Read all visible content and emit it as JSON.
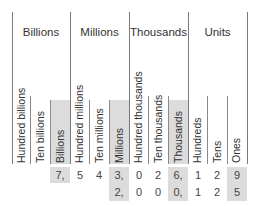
{
  "groups": [
    {
      "label": "Billions"
    },
    {
      "label": "Millions"
    },
    {
      "label": "Thousands"
    },
    {
      "label": "Units"
    }
  ],
  "columns": [
    {
      "label": "Hundred billions",
      "shaded": false
    },
    {
      "label": "Ten billions",
      "shaded": false
    },
    {
      "label": "Billions",
      "shaded": true
    },
    {
      "label": "Hundred millions",
      "shaded": false
    },
    {
      "label": "Ten millions",
      "shaded": false
    },
    {
      "label": "Millions",
      "shaded": true
    },
    {
      "label": "Hundred thousands",
      "shaded": false
    },
    {
      "label": "Ten thousands",
      "shaded": false
    },
    {
      "label": "Thousands",
      "shaded": true
    },
    {
      "label": "Hundreds",
      "shaded": false
    },
    {
      "label": "Tens",
      "shaded": false
    },
    {
      "label": "Ones",
      "shaded": true
    }
  ],
  "rows": [
    {
      "cells": [
        "",
        "",
        "7,",
        "5",
        "4",
        "3,",
        "0",
        "2",
        "6,",
        "1",
        "2",
        "9"
      ]
    },
    {
      "cells": [
        "",
        "",
        "",
        "",
        "",
        "2,",
        "0",
        "0",
        "0,",
        "1",
        "2",
        "5"
      ]
    }
  ],
  "colors": {
    "shade": "#dcdcdc",
    "line": "#7a7a7a",
    "text": "#333333"
  }
}
